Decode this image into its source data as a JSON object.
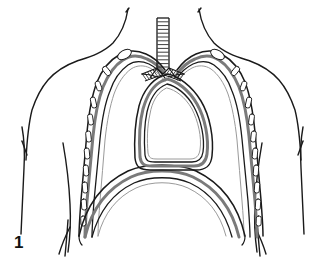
{
  "figure": {
    "number": "1",
    "caption_text": "1",
    "background_color": "#ffffff",
    "ink_color": "#1a1a1a",
    "pleura_band_color": "#7a7a7a",
    "pleura_band_light_color": "#b4b4b4",
    "rib_fill_color": "#ffffff",
    "width_px": 324,
    "height_px": 271
  },
  "parts": [
    {
      "id": "body-outline",
      "label": "Body outline (neck, shoulders, torso)",
      "stroke": "#1a1a1a",
      "stroke_width": 1.4
    },
    {
      "id": "left-arm-contour",
      "label": "Left arm contour line",
      "stroke": "#1a1a1a",
      "stroke_width": 1.4
    },
    {
      "id": "right-arm-contour",
      "label": "Right arm contour line",
      "stroke": "#1a1a1a",
      "stroke_width": 1.4
    },
    {
      "id": "trachea",
      "label": "Trachea with cartilage rings",
      "ring_count": 13,
      "stroke": "#1a1a1a",
      "stroke_width": 1.2
    },
    {
      "id": "carina",
      "label": "Carina / tracheal bifurcation",
      "stroke": "#1a1a1a"
    },
    {
      "id": "left-main-bronchus",
      "label": "Left main bronchus",
      "ring_count": 7,
      "stroke": "#1a1a1a"
    },
    {
      "id": "right-main-bronchus",
      "label": "Right main bronchus",
      "ring_count": 7,
      "stroke": "#1a1a1a"
    },
    {
      "id": "left-pleural-cavity",
      "label": "Left pleural cavity (parietal and visceral pleura)",
      "stroke": "#1a1a1a",
      "band": "#7a7a7a"
    },
    {
      "id": "right-pleural-cavity",
      "label": "Right pleural cavity (parietal and visceral pleura)",
      "stroke": "#1a1a1a",
      "band": "#7a7a7a"
    },
    {
      "id": "mediastinum",
      "label": "Mediastinum (central compartment)",
      "stroke": "#1a1a1a",
      "band": "#7a7a7a"
    },
    {
      "id": "diaphragm",
      "label": "Diaphragm dome",
      "stroke": "#1a1a1a"
    },
    {
      "id": "left-rib-chain",
      "label": "Left rib cross-sections",
      "rib_count": 11,
      "fill": "#ffffff"
    },
    {
      "id": "right-rib-chain",
      "label": "Right rib cross-sections",
      "rib_count": 11,
      "fill": "#ffffff"
    },
    {
      "id": "left-first-rib",
      "label": "Left first rib (oval)",
      "fill": "#ffffff"
    },
    {
      "id": "right-first-rib",
      "label": "Right first rib (oval)",
      "fill": "#ffffff"
    }
  ]
}
